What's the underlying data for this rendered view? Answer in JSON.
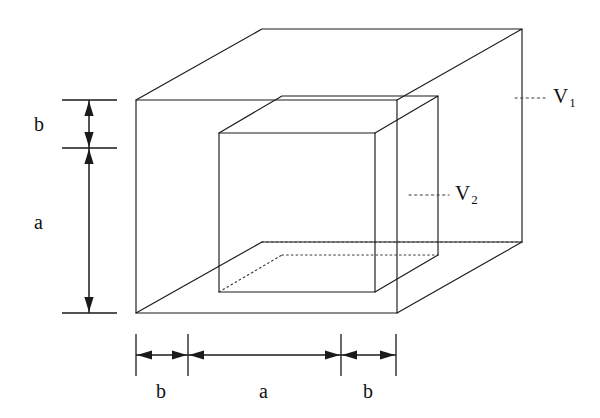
{
  "figure": {
    "stroke_color": "#1a1a1a",
    "background_color": "#ffffff",
    "hidden_line_color": "#3a3a3a"
  },
  "volumes": [
    {
      "id": "outer",
      "label": "V",
      "subscript": "1",
      "name": "outer-box-volume-label"
    },
    {
      "id": "inner",
      "label": "V",
      "subscript": "2",
      "name": "inner-cube-volume-label"
    }
  ],
  "vertical_dimensions": [
    {
      "id": "v-b",
      "label": "b",
      "segment": "top-gap"
    },
    {
      "id": "v-a",
      "label": "a",
      "segment": "inner-cube-height"
    }
  ],
  "horizontal_dimensions": [
    {
      "id": "h-b-left",
      "label": "b",
      "segment": "left-gap"
    },
    {
      "id": "h-a",
      "label": "a",
      "segment": "inner-cube-width"
    },
    {
      "id": "h-b-right",
      "label": "b",
      "segment": "right-gap"
    }
  ],
  "geometry": {
    "outer_box": {
      "front_face": {
        "left": 136,
        "right": 397,
        "top": 100,
        "bottom": 313
      },
      "depth_dx": 126,
      "depth_dy": -71
    },
    "inner_cube": {
      "front_face": {
        "left": 219,
        "right": 375,
        "top": 133,
        "bottom": 292
      },
      "depth_dx": 63,
      "depth_dy": -37
    }
  },
  "leaders": {
    "v1": {
      "from_x": 522,
      "to_x": 545,
      "y": 98
    },
    "v2": {
      "from_x": 415,
      "to_x": 447,
      "y": 195
    }
  }
}
